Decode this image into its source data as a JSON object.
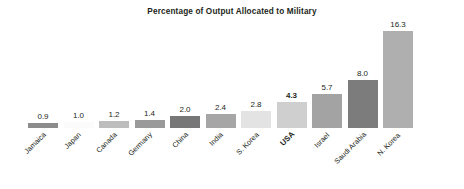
{
  "chart_data": {
    "type": "bar",
    "title": "Percentage of Output Allocated to Military",
    "xlabel": "",
    "ylabel": "",
    "ylim": [
      0,
      17.5
    ],
    "grid": false,
    "legend": null,
    "orientation": "vertical",
    "value_labels_shown": true,
    "categories": [
      "Jamaica",
      "Japan",
      "Canada",
      "Germany",
      "China",
      "India",
      "S. Korea",
      "USA",
      "Israel",
      "Saudi Arabia",
      "N. Korea"
    ],
    "values": [
      0.9,
      1.0,
      1.2,
      1.4,
      2.0,
      2.4,
      2.8,
      4.3,
      5.7,
      8.0,
      16.3
    ],
    "value_labels": [
      "0.9",
      "1.0",
      "1.2",
      "1.4",
      "2.0",
      "2.4",
      "2.8",
      "4.3",
      "5.7",
      "8.0",
      "16.3"
    ],
    "bar_colors": [
      "#8c8c8c",
      "#fbfbfb",
      "#bdbdbd",
      "#9a9a9a",
      "#777777",
      "#a6a6a6",
      "#e3e3e3",
      "#cfcfcf",
      "#a3a3a3",
      "#7c7c7c",
      "#afafaf"
    ],
    "highlight_category": "USA",
    "bars": [
      {
        "category": "Jamaica",
        "value": 0.9,
        "label": "0.9",
        "color": "#8c8c8c",
        "highlight": false
      },
      {
        "category": "Japan",
        "value": 1.0,
        "label": "1.0",
        "color": "#fbfbfb",
        "highlight": false
      },
      {
        "category": "Canada",
        "value": 1.2,
        "label": "1.2",
        "color": "#bdbdbd",
        "highlight": false
      },
      {
        "category": "Germany",
        "value": 1.4,
        "label": "1.4",
        "color": "#9a9a9a",
        "highlight": false
      },
      {
        "category": "China",
        "value": 2.0,
        "label": "2.0",
        "color": "#777777",
        "highlight": false
      },
      {
        "category": "India",
        "value": 2.4,
        "label": "2.4",
        "color": "#a6a6a6",
        "highlight": false
      },
      {
        "category": "S. Korea",
        "value": 2.8,
        "label": "2.8",
        "color": "#e3e3e3",
        "highlight": false
      },
      {
        "category": "USA",
        "value": 4.3,
        "label": "4.3",
        "color": "#cfcfcf",
        "highlight": true
      },
      {
        "category": "Israel",
        "value": 5.7,
        "label": "5.7",
        "color": "#a3a3a3",
        "highlight": false
      },
      {
        "category": "Saudi Arabia",
        "value": 8.0,
        "label": "8.0",
        "color": "#7c7c7c",
        "highlight": false
      },
      {
        "category": "N. Korea",
        "value": 16.3,
        "label": "16.3",
        "color": "#afafaf",
        "highlight": false
      }
    ]
  }
}
